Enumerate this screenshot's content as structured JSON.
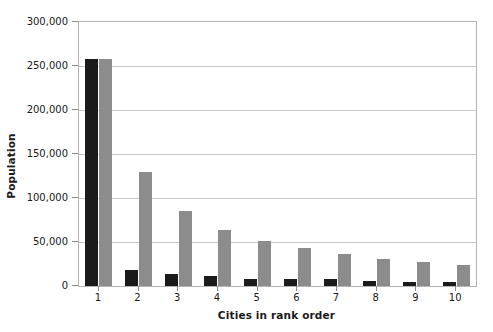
{
  "chart_data": {
    "type": "bar",
    "title": "",
    "xlabel": "Cities in rank order",
    "ylabel": "Population",
    "categories": [
      "1",
      "2",
      "3",
      "4",
      "5",
      "6",
      "7",
      "8",
      "9",
      "10"
    ],
    "series": [
      {
        "name": "dark-series",
        "color": "#1a1a1a",
        "values": [
          258000,
          18000,
          14000,
          11000,
          8000,
          8000,
          7500,
          5500,
          5000,
          4500
        ]
      },
      {
        "name": "light-series",
        "color": "#8c8c8c",
        "values": [
          258000,
          130000,
          85000,
          64000,
          51000,
          43000,
          36000,
          31000,
          27000,
          24000
        ]
      }
    ],
    "ylim": [
      0,
      300000
    ],
    "ytick_values": [
      0,
      50000,
      100000,
      150000,
      200000,
      250000,
      300000
    ],
    "ytick_labels": [
      "0",
      "50,000",
      "100,000",
      "150,000",
      "200,000",
      "250,000",
      "300,000"
    ],
    "grid": true,
    "grid_axis": "y",
    "legend": false,
    "legend_position": "none",
    "plot_border_color": "#b3b3b3",
    "gridline_color": "#c8c8c8",
    "background_color": "#ffffff"
  }
}
